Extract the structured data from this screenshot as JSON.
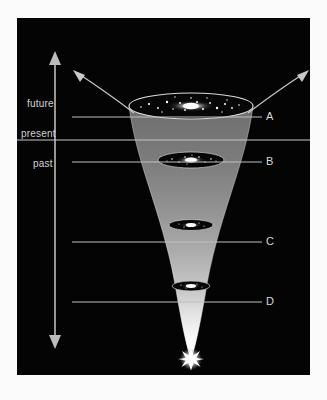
{
  "figure": {
    "type": "cosmology-diagram",
    "background_color": "#040404",
    "frame_color": "#fbfbfb",
    "line_color": "#c9c9c9"
  },
  "time_axis": {
    "arrow_name": "time-direction-arrow",
    "direction": "double-headed vertical",
    "eras": [
      {
        "id": "future",
        "label": "future",
        "x": 27,
        "y": 86
      },
      {
        "id": "present",
        "label": "present",
        "x": 20,
        "y": 116
      },
      {
        "id": "past",
        "label": "past",
        "x": 33,
        "y": 146
      }
    ],
    "present_line": {
      "name": "present-divider-line",
      "y": 140
    }
  },
  "callouts": [
    {
      "id": "A",
      "label": "A",
      "y": 117,
      "line_start_x": 72,
      "line_end_x": 262
    },
    {
      "id": "B",
      "label": "B",
      "y": 162,
      "line_start_x": 72,
      "line_end_x": 262
    },
    {
      "id": "C",
      "label": "C",
      "y": 242,
      "line_start_x": 72,
      "line_end_x": 262
    },
    {
      "id": "D",
      "label": "D",
      "y": 302,
      "line_start_x": 72,
      "line_end_x": 262
    }
  ],
  "galaxies": [
    {
      "id": "galaxy-top",
      "y": 88,
      "rx": 62,
      "ry": 13,
      "core": "bright"
    },
    {
      "id": "galaxy-present",
      "y": 142,
      "rx": 33,
      "ry": 8,
      "core": "bright"
    },
    {
      "id": "galaxy-mid",
      "y": 207,
      "rx": 22,
      "ry": 5.5,
      "core": "bright"
    },
    {
      "id": "galaxy-early",
      "y": 268,
      "rx": 19,
      "ry": 5,
      "core": "bright"
    }
  ],
  "big_bang": {
    "name": "big-bang-starburst",
    "x": 174,
    "y": 341,
    "radius": 11
  },
  "expansion_arrows": [
    {
      "id": "left-expansion-arrow",
      "from": [
        115,
        95
      ],
      "to": [
        60,
        55
      ]
    },
    {
      "id": "right-expansion-arrow",
      "from": [
        233,
        95
      ],
      "to": [
        288,
        55
      ]
    }
  ]
}
